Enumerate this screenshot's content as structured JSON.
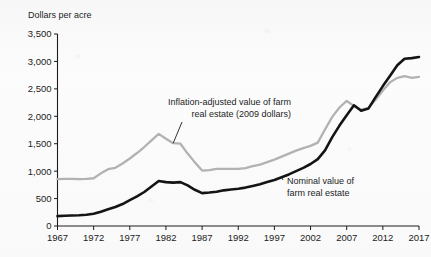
{
  "chart_data": {
    "type": "line",
    "title": "",
    "ylabel": "Dollars per acre",
    "xlabel": "",
    "ylim": [
      0,
      3500
    ],
    "xlim": [
      1967,
      2017
    ],
    "ytick_labels": [
      "0",
      "500",
      "1,000",
      "1,500",
      "2,000",
      "2,500",
      "3,000",
      "3,500"
    ],
    "ytick_values": [
      0,
      500,
      1000,
      1500,
      2000,
      2500,
      3000,
      3500
    ],
    "xtick_labels": [
      "1967",
      "1972",
      "1977",
      "1982",
      "1987",
      "1992",
      "1997",
      "2002",
      "2007",
      "2012",
      "2017"
    ],
    "xtick_values": [
      1967,
      1972,
      1977,
      1982,
      1987,
      1992,
      1997,
      2002,
      2007,
      2012,
      2017
    ],
    "grid": false,
    "legend_position": "inline-annotations",
    "x": [
      1967,
      1968,
      1969,
      1970,
      1971,
      1972,
      1973,
      1974,
      1975,
      1976,
      1977,
      1978,
      1979,
      1980,
      1981,
      1982,
      1983,
      1984,
      1985,
      1986,
      1987,
      1988,
      1989,
      1990,
      1991,
      1992,
      1993,
      1994,
      1995,
      1996,
      1997,
      1998,
      1999,
      2000,
      2001,
      2002,
      2003,
      2004,
      2005,
      2006,
      2007,
      2008,
      2009,
      2010,
      2011,
      2012,
      2013,
      2014,
      2015,
      2016,
      2017
    ],
    "series": [
      {
        "name": "Inflation-adjusted value of farm real estate (2009 dollars)",
        "color": "#b2b2b2",
        "values": [
          855,
          860,
          860,
          855,
          860,
          870,
          960,
          1035,
          1060,
          1140,
          1230,
          1330,
          1440,
          1560,
          1680,
          1590,
          1510,
          1500,
          1320,
          1160,
          1010,
          1020,
          1040,
          1040,
          1040,
          1040,
          1055,
          1090,
          1120,
          1165,
          1210,
          1265,
          1320,
          1375,
          1420,
          1460,
          1520,
          1760,
          1990,
          2160,
          2280,
          2190,
          2120,
          2150,
          2300,
          2470,
          2620,
          2700,
          2730,
          2700,
          2720
        ]
      },
      {
        "name": "Nominal value of farm real estate",
        "color": "#141414",
        "values": [
          180,
          186,
          192,
          196,
          205,
          222,
          260,
          305,
          345,
          400,
          470,
          540,
          620,
          720,
          820,
          800,
          790,
          800,
          740,
          660,
          600,
          610,
          625,
          650,
          665,
          680,
          700,
          730,
          760,
          800,
          840,
          890,
          940,
          1000,
          1060,
          1130,
          1220,
          1380,
          1620,
          1830,
          2020,
          2200,
          2100,
          2140,
          2350,
          2550,
          2740,
          2930,
          3050,
          3060,
          3080
        ]
      }
    ],
    "annotations": [
      {
        "id": "real-series-label",
        "lines": [
          "Inflation-adjusted value of farm",
          "real estate (2009 dollars)"
        ],
        "anchor_year": 1983,
        "anchor_value": 1510
      },
      {
        "id": "nominal-series-label",
        "lines": [
          "Nominal value of",
          "farm real estate"
        ],
        "anchor_year": 1998,
        "anchor_value": 890
      }
    ]
  }
}
